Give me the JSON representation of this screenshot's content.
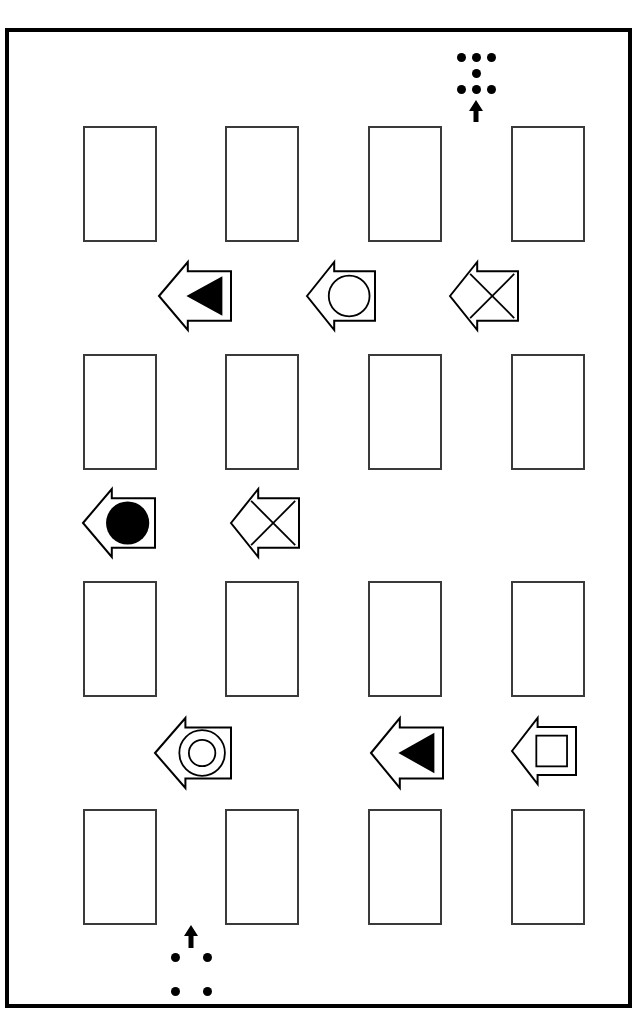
{
  "page": {
    "width": 640,
    "height": 1021,
    "background_color": "#ffffff",
    "border_color": "#000000",
    "ink_color": "#000000",
    "rect_stroke_color": "#3a3a3a"
  },
  "frame": {
    "x": 5,
    "y": 28,
    "width": 627,
    "height": 980,
    "stroke_width": 4
  },
  "marker_top": {
    "name": "top-registration-marker",
    "dot_rows": [
      {
        "y": 57,
        "xs": [
          461,
          476,
          491
        ]
      },
      {
        "y": 73,
        "xs": [
          476
        ]
      },
      {
        "y": 89,
        "xs": [
          461,
          476,
          491
        ]
      }
    ],
    "dot_radius": 4.5,
    "arrow": {
      "x": 476,
      "y_top": 100,
      "y_bottom": 122,
      "direction": "up"
    }
  },
  "marker_bottom": {
    "name": "bottom-registration-marker",
    "arrow": {
      "x": 191,
      "y_top": 925,
      "y_bottom": 948,
      "direction": "up"
    },
    "dot_rows": [
      {
        "y": 957,
        "xs": [
          175,
          207
        ]
      },
      {
        "y": 991,
        "xs": [
          175,
          207
        ]
      }
    ],
    "dot_radius": 4.5
  },
  "box_rows": [
    {
      "row_index": 1,
      "name": "box-row-1",
      "y": 126,
      "boxes": [
        {
          "x": 83,
          "y": 126,
          "w": 74,
          "h": 116,
          "fill": "empty"
        },
        {
          "x": 225,
          "y": 126,
          "w": 74,
          "h": 116,
          "fill": "empty"
        },
        {
          "x": 368,
          "y": 126,
          "w": 74,
          "h": 116,
          "fill": "empty"
        },
        {
          "x": 511,
          "y": 126,
          "w": 74,
          "h": 116,
          "fill": "empty"
        }
      ]
    },
    {
      "row_index": 2,
      "name": "box-row-2",
      "y": 354,
      "boxes": [
        {
          "x": 83,
          "y": 354,
          "w": 74,
          "h": 116,
          "fill": "empty"
        },
        {
          "x": 225,
          "y": 354,
          "w": 74,
          "h": 116,
          "fill": "empty"
        },
        {
          "x": 368,
          "y": 354,
          "w": 74,
          "h": 116,
          "fill": "empty"
        },
        {
          "x": 511,
          "y": 354,
          "w": 74,
          "h": 116,
          "fill": "empty"
        }
      ]
    },
    {
      "row_index": 3,
      "name": "box-row-3",
      "y": 581,
      "boxes": [
        {
          "x": 83,
          "y": 581,
          "w": 74,
          "h": 116,
          "fill": "empty"
        },
        {
          "x": 225,
          "y": 581,
          "w": 74,
          "h": 116,
          "fill": "empty"
        },
        {
          "x": 368,
          "y": 581,
          "w": 74,
          "h": 116,
          "fill": "empty"
        },
        {
          "x": 511,
          "y": 581,
          "w": 74,
          "h": 116,
          "fill": "empty"
        }
      ]
    },
    {
      "row_index": 4,
      "name": "box-row-4",
      "y": 809,
      "boxes": [
        {
          "x": 83,
          "y": 809,
          "w": 74,
          "h": 116,
          "fill": "empty"
        },
        {
          "x": 225,
          "y": 809,
          "w": 74,
          "h": 116,
          "fill": "empty"
        },
        {
          "x": 368,
          "y": 809,
          "w": 74,
          "h": 116,
          "fill": "empty"
        },
        {
          "x": 511,
          "y": 809,
          "w": 74,
          "h": 116,
          "fill": "empty"
        }
      ]
    }
  ],
  "arrow_rows": [
    {
      "row_index": 1,
      "name": "arrow-row-1",
      "y": 262,
      "arrows": [
        {
          "id": "arrow-1-1",
          "x": 159,
          "y": 262,
          "w": 72,
          "h": 68,
          "direction": "left",
          "symbol": "triangle-left-filled",
          "symbol_label": "filled left triangle",
          "filled": true
        },
        {
          "id": "arrow-1-2",
          "x": 307,
          "y": 262,
          "w": 68,
          "h": 68,
          "direction": "left",
          "symbol": "circle-outline",
          "symbol_label": "open circle",
          "filled": false
        },
        {
          "id": "arrow-1-3",
          "x": 450,
          "y": 262,
          "w": 68,
          "h": 68,
          "direction": "left",
          "symbol": "cross-x",
          "symbol_label": "X cross",
          "filled": false
        }
      ]
    },
    {
      "row_index": 2,
      "name": "arrow-row-2",
      "y": 489,
      "arrows": [
        {
          "id": "arrow-2-1",
          "x": 83,
          "y": 489,
          "w": 72,
          "h": 68,
          "direction": "left",
          "symbol": "circle-filled",
          "symbol_label": "filled circle",
          "filled": true
        },
        {
          "id": "arrow-2-2",
          "x": 231,
          "y": 489,
          "w": 68,
          "h": 68,
          "direction": "left",
          "symbol": "cross-x",
          "symbol_label": "X cross",
          "filled": false
        }
      ]
    },
    {
      "row_index": 3,
      "name": "arrow-row-3",
      "y": 718,
      "arrows": [
        {
          "id": "arrow-3-1",
          "x": 155,
          "y": 718,
          "w": 76,
          "h": 70,
          "direction": "left",
          "symbol": "concentric-circles",
          "symbol_label": "ring / concentric circles",
          "filled": false
        },
        {
          "id": "arrow-3-2",
          "x": 371,
          "y": 718,
          "w": 72,
          "h": 70,
          "direction": "left",
          "symbol": "triangle-left-filled",
          "symbol_label": "filled left triangle",
          "filled": true
        },
        {
          "id": "arrow-3-3",
          "x": 512,
          "y": 718,
          "w": 64,
          "h": 66,
          "direction": "left",
          "symbol": "square-outline",
          "symbol_label": "open square",
          "filled": false
        }
      ]
    }
  ]
}
